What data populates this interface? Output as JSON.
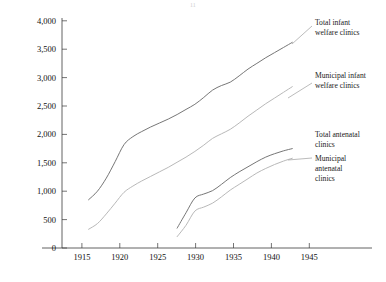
{
  "figure": {
    "background_color": "#ffffff",
    "axis_color": "#3a3a3a",
    "page_artifact": "11"
  },
  "chart_data": {
    "type": "line",
    "title": "",
    "subtitle": "",
    "xlabel": "",
    "ylabel": "",
    "xlim": [
      1913,
      1948
    ],
    "ylim": [
      0,
      4000
    ],
    "grid": false,
    "legend_position": "right-inline-labels",
    "x_ticks": [
      "1915",
      "1920",
      "1925",
      "1930",
      "1935",
      "1940",
      "1945"
    ],
    "x_tick_values": [
      1915,
      1920,
      1925,
      1930,
      1935,
      1940,
      1945
    ],
    "y_ticks": [
      "0",
      "500",
      "1,000",
      "1,500",
      "2,000",
      "2,500",
      "3,000",
      "3,500",
      "4,000"
    ],
    "y_tick_values": [
      0,
      500,
      1000,
      1500,
      2000,
      2500,
      3000,
      3500,
      4000
    ],
    "series": [
      {
        "name": "Total infant welfare clinics",
        "label_lines": [
          "Total infant",
          "welfare clinics"
        ],
        "color": "#6f6f6f",
        "x": [
          1916,
          1917,
          1918,
          1919,
          1920,
          1921,
          1922,
          1923,
          1924,
          1925,
          1926,
          1927,
          1928,
          1929,
          1930,
          1931,
          1932,
          1933,
          1934,
          1935,
          1936,
          1937,
          1938,
          1939
        ],
        "values": [
          850,
          1000,
          1230,
          1520,
          1820,
          1960,
          2050,
          2130,
          2200,
          2270,
          2350,
          2440,
          2530,
          2650,
          2780,
          2860,
          2920,
          3030,
          3150,
          3250,
          3350,
          3440,
          3530,
          3620
        ]
      },
      {
        "name": "Municipal infant welfare clinics",
        "label_lines": [
          "Municipal infant",
          "welfare clinics"
        ],
        "color": "#b4b4b4",
        "x": [
          1916,
          1917,
          1918,
          1919,
          1920,
          1921,
          1922,
          1923,
          1924,
          1925,
          1926,
          1927,
          1928,
          1929,
          1930,
          1931,
          1932,
          1933,
          1934,
          1935,
          1936,
          1937,
          1938,
          1939
        ],
        "values": [
          330,
          430,
          600,
          790,
          980,
          1090,
          1180,
          1260,
          1340,
          1420,
          1510,
          1600,
          1700,
          1810,
          1930,
          2010,
          2090,
          2200,
          2320,
          2430,
          2540,
          2640,
          2740,
          2840
        ]
      },
      {
        "name": "Total antenatal clinics",
        "label_lines": [
          "Total antenatal",
          "clinics"
        ],
        "color": "#6f6f6f",
        "x": [
          1926,
          1927,
          1928,
          1929,
          1930,
          1931,
          1932,
          1933,
          1934,
          1935,
          1936,
          1937,
          1938,
          1939
        ],
        "values": [
          350,
          620,
          880,
          950,
          1010,
          1120,
          1240,
          1340,
          1430,
          1520,
          1600,
          1660,
          1710,
          1750
        ]
      },
      {
        "name": "Municipal antenatal clinics",
        "label_lines": [
          "Municipal",
          "antenatal",
          "clinics"
        ],
        "color": "#b4b4b4",
        "x": [
          1926,
          1927,
          1928,
          1929,
          1930,
          1931,
          1932,
          1933,
          1934,
          1935,
          1936,
          1937,
          1938,
          1939
        ],
        "values": [
          200,
          400,
          650,
          720,
          790,
          900,
          1020,
          1120,
          1220,
          1320,
          1400,
          1470,
          1530,
          1580
        ]
      }
    ],
    "annotations": [
      {
        "name": "label-total-infant-welfare",
        "lines": [
          "Total infant",
          "welfare clinics"
        ]
      },
      {
        "name": "label-municipal-infant-welfare",
        "lines": [
          "Municipal infant",
          "welfare clinics"
        ]
      },
      {
        "name": "label-total-antenatal",
        "lines": [
          "Total antenatal",
          "clinics"
        ]
      },
      {
        "name": "label-municipal-antenatal",
        "lines": [
          "Municipal",
          "antenatal",
          "clinics"
        ]
      }
    ]
  }
}
